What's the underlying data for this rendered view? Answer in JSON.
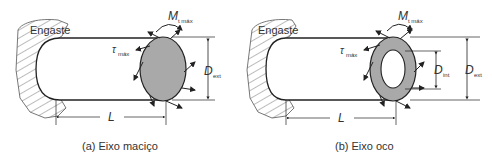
{
  "figures": [
    {
      "id": "a",
      "caption": "(a) Eixo maciço",
      "support_label": "Engaste",
      "moment_label": "M",
      "moment_sub": "t máx",
      "stress_label": "τ",
      "stress_sub": "máx",
      "diameter_label": "D",
      "diameter_sub": "ext",
      "length_label": "L"
    },
    {
      "id": "b",
      "caption": "(b) Eixo oco",
      "support_label": "Engaste",
      "moment_label": "M",
      "moment_sub": "t máx",
      "stress_label": "τ",
      "stress_sub": "máx",
      "inner_diameter_label": "D",
      "inner_diameter_sub": "int",
      "diameter_label": "D",
      "diameter_sub": "ext",
      "length_label": "L"
    }
  ],
  "colors": {
    "line": "#222222",
    "section_fill": "#a9a9a9",
    "hatch": "#555555"
  }
}
